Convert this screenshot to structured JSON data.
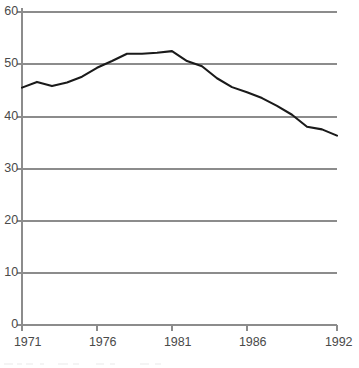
{
  "chart_data": {
    "type": "line",
    "title": "",
    "subtitle": "",
    "xlabel": "",
    "ylabel": "",
    "xlim": [
      1971,
      1992
    ],
    "ylim": [
      0,
      60
    ],
    "grid": true,
    "grid_axis": "y",
    "legend": false,
    "legend_position": "none",
    "x": [
      1971,
      1972,
      1973,
      1974,
      1975,
      1976,
      1977,
      1978,
      1979,
      1980,
      1981,
      1982,
      1983,
      1984,
      1985,
      1986,
      1987,
      1988,
      1989,
      1990,
      1991,
      1992
    ],
    "values": [
      45.5,
      46.6,
      45.8,
      46.5,
      47.6,
      49.3,
      50.6,
      52.0,
      52.0,
      52.2,
      52.5,
      50.6,
      49.6,
      47.3,
      45.6,
      44.6,
      43.5,
      42.0,
      40.3,
      38.0,
      37.5,
      36.3
    ],
    "series": [
      {
        "name": "series-1",
        "color": "#1a1a1a",
        "values": [
          45.5,
          46.6,
          45.8,
          46.5,
          47.6,
          49.3,
          50.6,
          52.0,
          52.0,
          52.2,
          52.5,
          50.6,
          49.6,
          47.3,
          45.6,
          44.6,
          43.5,
          42.0,
          40.3,
          38.0,
          37.5,
          36.3
        ]
      }
    ],
    "y_ticks": [
      0,
      10,
      20,
      30,
      40,
      50,
      60
    ],
    "y_tick_labels": [
      "0",
      "10",
      "20",
      "30",
      "40",
      "50",
      "60"
    ],
    "x_ticks": [
      1971,
      1976,
      1981,
      1986,
      1992
    ],
    "x_tick_labels": [
      "1971",
      "1976",
      "1981",
      "1986",
      "1992"
    ],
    "colors": {
      "line": "#1a1a1a",
      "grid": "#8c8c8c",
      "axis": "#8c8c8c",
      "text": "#4a4a4a",
      "background": "#ffffff"
    }
  },
  "axes": {
    "y_labels": [
      "60",
      "50",
      "40",
      "30",
      "20",
      "10",
      "0"
    ],
    "x_labels": [
      "1971",
      "1976",
      "1981",
      "1986",
      "1992"
    ]
  }
}
